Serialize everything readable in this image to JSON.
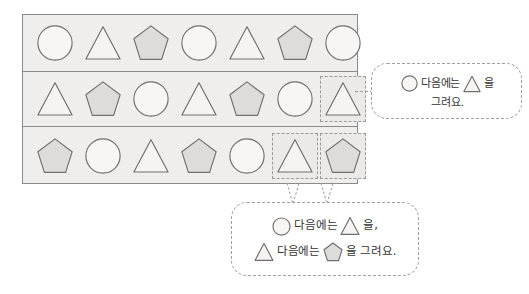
{
  "board": {
    "name": "pattern-board",
    "rows": [
      {
        "id": "row-1",
        "cells": [
          {
            "shape": "circle",
            "boxed": false
          },
          {
            "shape": "triangle",
            "boxed": false
          },
          {
            "shape": "pentagon",
            "boxed": false
          },
          {
            "shape": "circle",
            "boxed": false
          },
          {
            "shape": "triangle",
            "boxed": false
          },
          {
            "shape": "pentagon",
            "boxed": false
          },
          {
            "shape": "circle",
            "boxed": false
          }
        ]
      },
      {
        "id": "row-2",
        "cells": [
          {
            "shape": "triangle",
            "boxed": false
          },
          {
            "shape": "pentagon",
            "boxed": false
          },
          {
            "shape": "circle",
            "boxed": false
          },
          {
            "shape": "triangle",
            "boxed": false
          },
          {
            "shape": "pentagon",
            "boxed": false
          },
          {
            "shape": "circle",
            "boxed": false
          },
          {
            "shape": "triangle",
            "boxed": true
          }
        ]
      },
      {
        "id": "row-3",
        "cells": [
          {
            "shape": "pentagon",
            "boxed": false
          },
          {
            "shape": "circle",
            "boxed": false
          },
          {
            "shape": "triangle",
            "boxed": false
          },
          {
            "shape": "pentagon",
            "boxed": false
          },
          {
            "shape": "circle",
            "boxed": false
          },
          {
            "shape": "triangle",
            "boxed": true
          },
          {
            "shape": "pentagon",
            "boxed": true
          }
        ]
      }
    ]
  },
  "bubbles": {
    "right": {
      "name": "speech-bubble-right",
      "lines": [
        {
          "parts": [
            {
              "type": "shape",
              "shape": "circle",
              "size": 17
            },
            {
              "type": "text",
              "text": "다음에는"
            },
            {
              "type": "shape",
              "shape": "triangle",
              "size": 18
            },
            {
              "type": "text",
              "text": "을"
            }
          ]
        },
        {
          "parts": [
            {
              "type": "text",
              "text": "그려요."
            }
          ]
        }
      ]
    },
    "bottom": {
      "name": "speech-bubble-bottom",
      "lines": [
        {
          "parts": [
            {
              "type": "shape",
              "shape": "circle",
              "size": 19
            },
            {
              "type": "text",
              "text": "다음에는"
            },
            {
              "type": "shape",
              "shape": "triangle",
              "size": 20
            },
            {
              "type": "text",
              "text": "을,"
            }
          ]
        },
        {
          "parts": [
            {
              "type": "shape",
              "shape": "triangle",
              "size": 20
            },
            {
              "type": "text",
              "text": "다음에는"
            },
            {
              "type": "shape",
              "shape": "pentagon",
              "size": 20
            },
            {
              "type": "text",
              "text": "을 그려요."
            }
          ]
        }
      ]
    }
  },
  "colors": {
    "board_background": "#efeeec",
    "board_border": "#8a8a8a",
    "shape_stroke": "#6f6f6f",
    "circle_fill": "#f7f6f5",
    "triangle_fill": "#f5f4f2",
    "pentagon_fill": "#dedcda",
    "dashed_border": "#9a9a9a",
    "bubble_background": "#ffffff",
    "text": "#333333"
  },
  "connectors": [
    {
      "name": "connector-to-right-bubble",
      "from": "row-2-cell-7",
      "to": "speech-bubble-right"
    },
    {
      "name": "connector-to-bottom-bubble-triangle",
      "from": "row-3-cell-6",
      "to": "speech-bubble-bottom"
    },
    {
      "name": "connector-to-bottom-bubble-pentagon",
      "from": "row-3-cell-7",
      "to": "speech-bubble-bottom"
    }
  ]
}
